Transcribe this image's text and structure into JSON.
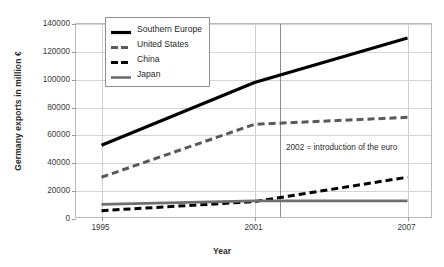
{
  "chart_data": {
    "type": "line",
    "title": "",
    "xlabel": "Year",
    "ylabel": "Germany exports in million €",
    "x": [
      1995,
      2001,
      2007
    ],
    "xlim": [
      1994,
      2008
    ],
    "ylim": [
      0,
      140000
    ],
    "ytick_values": [
      0,
      20000,
      40000,
      60000,
      80000,
      100000,
      120000,
      140000
    ],
    "ytick_labels": [
      "0",
      "20000",
      "40000",
      "60000",
      "80000",
      "100000",
      "120000",
      "140000"
    ],
    "xtick_labels": [
      "1995",
      "2001",
      "2007"
    ],
    "grid": "horizontal",
    "legend_position": "top-left-inside",
    "series": [
      {
        "name": "Southern Europe",
        "style": "solid",
        "color": "#000000",
        "width": 3.2,
        "values": [
          53000,
          98000,
          130000
        ]
      },
      {
        "name": "United States",
        "style": "dashed",
        "color": "#595959",
        "width": 3.0,
        "values": [
          30000,
          68000,
          73000
        ]
      },
      {
        "name": "China",
        "style": "dashed",
        "color": "#000000",
        "width": 3.0,
        "values": [
          6000,
          12500,
          30000
        ]
      },
      {
        "name": "Japan",
        "style": "solid",
        "color": "#6e6e6e",
        "width": 2.6,
        "values": [
          10500,
          13000,
          13000
        ]
      }
    ],
    "annotations": [
      {
        "text": "2002 = introduction of the euro",
        "x": 2002,
        "y": 50000,
        "marker": "vertical-line"
      }
    ]
  }
}
